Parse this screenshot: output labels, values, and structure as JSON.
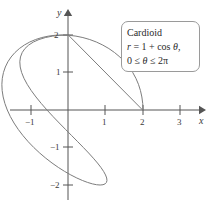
{
  "figure": {
    "background": "#ffffff",
    "width": 212,
    "height": 207
  },
  "axes": {
    "x_name": "x",
    "y_name": "y",
    "origin_px": {
      "x": 68,
      "y": 110
    },
    "unit_px": 37.5,
    "axis_color": "#555555",
    "x_ticks": [
      {
        "value": -1,
        "label": "−1",
        "px": 31
      },
      {
        "value": 1,
        "label": "1",
        "px": 105
      },
      {
        "value": 2,
        "label": "2",
        "px": 143
      },
      {
        "value": 3,
        "label": "3",
        "px": 180
      }
    ],
    "y_ticks": [
      {
        "value": 2,
        "label": "2",
        "px": 35
      },
      {
        "value": 1,
        "label": "1",
        "px": 72
      },
      {
        "value": -1,
        "label": "−1",
        "px": 147
      },
      {
        "value": -2,
        "label": "−2",
        "px": 185
      }
    ]
  },
  "legend": {
    "title": "Cardioid",
    "equation_prefix": "r",
    "equation_body": " = 1 + cos ",
    "equation_theta": "θ",
    "equation_suffix": ",",
    "domain_start": "0 ≤ ",
    "domain_theta": "θ",
    "domain_end": " ≤ 2π"
  },
  "chart_data": {
    "type": "line",
    "subtype": "polar",
    "title": "Cardioid",
    "equation": "r = 1 + cos θ",
    "theta_range": [
      0,
      6.283185307179586
    ],
    "theta_range_label": "0 ≤ θ ≤ 2π",
    "xlabel": "x",
    "ylabel": "y",
    "xlim": [
      -1.6,
      3.6
    ],
    "ylim": [
      -2.6,
      2.6
    ],
    "grid": false,
    "legend_position": "top-right",
    "curve_color": "#7d7d7d",
    "curve_width": 1,
    "key_points": {
      "max_r_point": [
        2,
        0
      ],
      "cusp": [
        0,
        0
      ],
      "top_crossing": [
        0,
        1
      ],
      "bottom_crossing": [
        0,
        -1
      ],
      "leftmost_x": -0.25,
      "max_y": 1.2990381056766582,
      "min_y": -1.2990381056766582
    },
    "points": [
      [
        2.0,
        0.0
      ],
      [
        1.9924,
        0.1743
      ],
      [
        1.9698,
        0.3472
      ],
      [
        1.9324,
        0.5176
      ],
      [
        1.8794,
        0.684
      ],
      [
        1.8107,
        0.8452
      ],
      [
        1.7262,
        1.0
      ],
      [
        1.6266,
        1.147
      ],
      [
        1.5114,
        1.2856
      ],
      [
        1.383,
        1.4142
      ],
      [
        1.2415,
        1.5321
      ],
      [
        1.0893,
        1.6383
      ],
      [
        0.927,
        1.7321
      ],
      [
        0.7565,
        1.8126
      ],
      [
        0.5792,
        1.8794
      ],
      [
        0.3972,
        1.9319
      ],
      [
        0.212,
        1.9696
      ],
      [
        0.0254,
        1.9924
      ],
      [
        -0.1607,
        2.0
      ],
      [
        -0.3445,
        1.9924
      ],
      [
        -0.5243,
        1.9696
      ],
      [
        -0.6981,
        1.9319
      ],
      [
        -0.8639,
        1.8794
      ],
      [
        -1.0201,
        1.8126
      ],
      [
        -1.1651,
        1.7321
      ],
      [
        -1.2971,
        1.6383
      ],
      [
        -1.415,
        1.5321
      ],
      [
        -1.5174,
        1.4142
      ],
      [
        -1.6031,
        1.2856
      ],
      [
        -1.6713,
        1.147
      ],
      [
        -1.721,
        1.0
      ],
      [
        -1.7518,
        0.8452
      ],
      [
        -1.7634,
        0.684
      ],
      [
        -1.7556,
        0.5176
      ],
      [
        -1.7287,
        0.3472
      ],
      [
        -1.683,
        0.1743
      ],
      [
        -1.619,
        0.0
      ],
      [
        -1.5375,
        -0.1743
      ],
      [
        -1.4397,
        -0.3472
      ],
      [
        -1.3267,
        -0.5176
      ],
      [
        -1.2,
        -0.684
      ],
      [
        -1.0613,
        -0.8452
      ],
      [
        -0.9124,
        -1.0
      ],
      [
        -0.7553,
        -1.147
      ],
      [
        -0.5921,
        -1.2856
      ],
      [
        -0.4251,
        -1.4142
      ],
      [
        -0.2565,
        -1.5321
      ],
      [
        -0.0888,
        -1.6383
      ],
      [
        0.0756,
        -1.7321
      ],
      [
        0.2341,
        -1.8126
      ],
      [
        0.3843,
        -1.8794
      ],
      [
        0.5238,
        -1.9319
      ],
      [
        0.6504,
        -1.9696
      ],
      [
        0.762,
        -1.9924
      ],
      [
        0.8568,
        -2.0
      ],
      [
        0.933,
        -1.9924
      ],
      [
        0.9894,
        -1.9696
      ],
      [
        1.0249,
        -1.9319
      ],
      [
        1.0389,
        -1.8794
      ],
      [
        1.0309,
        -1.8126
      ],
      [
        1.0011,
        -1.7321
      ],
      [
        0.9497,
        -1.6383
      ],
      [
        0.8776,
        -1.5321
      ],
      [
        0.7858,
        -1.4142
      ],
      [
        0.676,
        -1.2856
      ],
      [
        0.55,
        -1.147
      ],
      [
        0.4101,
        -1.0
      ],
      [
        0.2588,
        -0.8452
      ],
      [
        0.099,
        -0.684
      ],
      [
        -0.0662,
        -0.5176
      ],
      [
        -0.2334,
        -0.3472
      ],
      [
        -0.3993,
        -0.1743
      ],
      [
        -0.5603,
        0.0
      ],
      [
        -0.713,
        0.1743
      ],
      [
        -0.8539,
        0.3472
      ],
      [
        -0.9797,
        0.5176
      ],
      [
        -1.0873,
        0.684
      ],
      [
        -1.1738,
        0.8452
      ],
      [
        -1.2368,
        1.0
      ],
      [
        -1.2743,
        1.147
      ],
      [
        -1.2848,
        1.2856
      ],
      [
        -1.2675,
        1.4142
      ],
      [
        -1.2219,
        1.5321
      ],
      [
        -1.1485,
        1.6383
      ],
      [
        -1.0482,
        1.7321
      ],
      [
        -0.9225,
        1.8126
      ],
      [
        -0.7735,
        1.8794
      ],
      [
        -0.6038,
        1.9319
      ],
      [
        -0.4166,
        1.9696
      ],
      [
        -0.2153,
        1.9924
      ],
      [
        -0.0038,
        2.0
      ]
    ]
  }
}
